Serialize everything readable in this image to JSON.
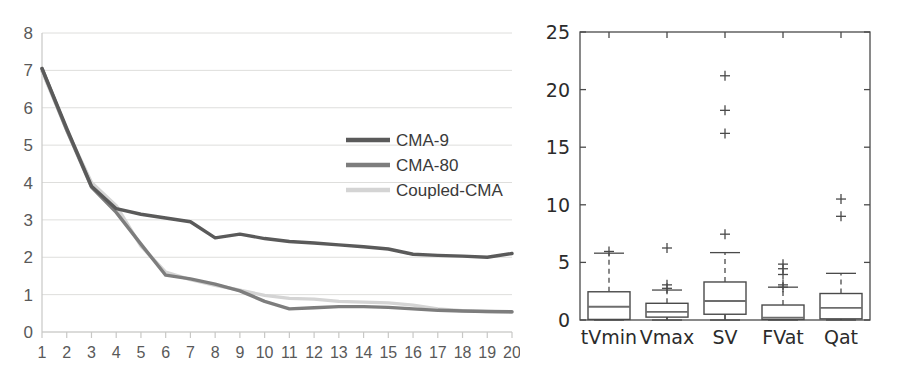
{
  "figure": {
    "title": "",
    "panels": [
      "convergence-line-chart",
      "feature-boxplot"
    ]
  },
  "chart_data": [
    {
      "id": "convergence-line-chart",
      "type": "line",
      "title": "",
      "xlabel": "",
      "ylabel": "",
      "xlim": [
        1,
        20
      ],
      "ylim": [
        0,
        8
      ],
      "grid": true,
      "grid_axis": "y",
      "legend_position": "upper-right-inside",
      "xticks": [
        1,
        2,
        3,
        4,
        5,
        6,
        7,
        8,
        9,
        10,
        11,
        12,
        13,
        14,
        15,
        16,
        17,
        18,
        19,
        20
      ],
      "xtick_labels": [
        "1",
        "2",
        "3",
        "4",
        "5",
        "6",
        "7",
        "8",
        "9",
        "10",
        "11",
        "12",
        "13",
        "14",
        "15",
        "16",
        "17",
        "18",
        "19",
        "20"
      ],
      "yticks": [
        0,
        1,
        2,
        3,
        4,
        5,
        6,
        7,
        8
      ],
      "ytick_labels": [
        "0",
        "1",
        "2",
        "3",
        "4",
        "5",
        "6",
        "7",
        "8"
      ],
      "x": [
        1,
        2,
        3,
        4,
        5,
        6,
        7,
        8,
        9,
        10,
        11,
        12,
        13,
        14,
        15,
        16,
        17,
        18,
        19,
        20
      ],
      "series": [
        {
          "name": "CMA-9",
          "color": "#5a5a5a",
          "values": [
            7.05,
            5.45,
            3.9,
            3.3,
            3.15,
            3.05,
            2.95,
            2.52,
            2.62,
            2.5,
            2.42,
            2.38,
            2.33,
            2.28,
            2.22,
            2.08,
            2.05,
            2.03,
            2.0,
            2.1
          ]
        },
        {
          "name": "CMA-80",
          "color": "#7d7d7d",
          "values": [
            7.05,
            5.4,
            3.88,
            3.2,
            2.35,
            1.52,
            1.42,
            1.28,
            1.1,
            0.82,
            0.62,
            0.65,
            0.68,
            0.68,
            0.66,
            0.62,
            0.58,
            0.56,
            0.55,
            0.54
          ]
        },
        {
          "name": "Coupled-CMA",
          "color": "#d4d4d4",
          "values": [
            6.98,
            5.4,
            4.0,
            3.38,
            2.3,
            1.6,
            1.4,
            1.25,
            1.12,
            0.98,
            0.9,
            0.88,
            0.82,
            0.8,
            0.78,
            0.72,
            0.62,
            0.57,
            0.55,
            0.53
          ]
        }
      ],
      "legend": [
        {
          "label": "CMA-9",
          "color": "#5a5a5a"
        },
        {
          "label": "CMA-80",
          "color": "#7d7d7d"
        },
        {
          "label": "Coupled-CMA",
          "color": "#d4d4d4"
        }
      ]
    },
    {
      "id": "feature-boxplot",
      "type": "boxplot",
      "title": "",
      "xlabel": "",
      "ylabel": "",
      "ylim": [
        0,
        25
      ],
      "grid": false,
      "yticks": [
        0,
        5,
        10,
        15,
        20,
        25
      ],
      "ytick_labels": [
        "0",
        "5",
        "10",
        "15",
        "20",
        "25"
      ],
      "categories": [
        "tVmin",
        "Vmax",
        "SV",
        "FVat",
        "Qat"
      ],
      "boxes": [
        {
          "label": "tVmin",
          "whisker_low": 0.0,
          "q1": 0.05,
          "median": 1.15,
          "q3": 2.45,
          "whisker_high": 5.8,
          "outliers": [
            5.95
          ]
        },
        {
          "label": "Vmax",
          "whisker_low": 0.0,
          "q1": 0.25,
          "median": 0.7,
          "q3": 1.45,
          "whisker_high": 2.6,
          "outliers": [
            3.05,
            2.75,
            6.25
          ]
        },
        {
          "label": "SV",
          "whisker_low": 0.0,
          "q1": 0.5,
          "median": 1.65,
          "q3": 3.3,
          "whisker_high": 5.85,
          "outliers": [
            7.45,
            16.2,
            18.2,
            21.2
          ]
        },
        {
          "label": "FVat",
          "whisker_low": 0.0,
          "q1": 0.05,
          "median": 0.2,
          "q3": 1.3,
          "whisker_high": 2.85,
          "outliers": [
            2.85,
            3.05,
            3.95,
            4.45,
            4.85
          ]
        },
        {
          "label": "Qat",
          "whisker_low": 0.0,
          "q1": 0.1,
          "median": 1.05,
          "q3": 2.3,
          "whisker_high": 4.05,
          "outliers": [
            9.0,
            10.5
          ]
        }
      ]
    }
  ]
}
